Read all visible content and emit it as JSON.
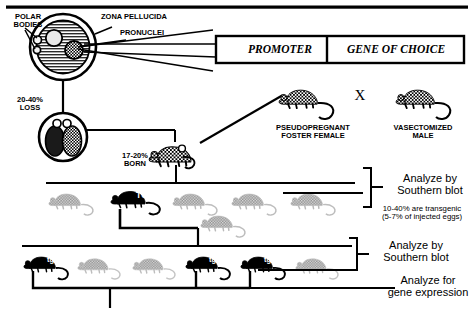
{
  "egg": {
    "polar_bodies_label": "POLAR\nBODIES",
    "zona_label": "ZONA PELLUCIDA",
    "pronuclei_label": "PRONUCLEI"
  },
  "construct": {
    "promoter": "PROMOTER",
    "gene": "GENE OF CHOICE"
  },
  "stages": {
    "loss_label": "20-40%\nLOSS",
    "born_label": "17-20%\nBORN"
  },
  "cross": {
    "female_label": "PSEUDOPREGNANT\nFOSTER FEMALE",
    "male_label": "VASECTOMIZED\nMALE",
    "cross_symbol": "X"
  },
  "analysis": {
    "southern_1": "Analyze by\nSouthern blot",
    "rate_note": "10-40% are transgenic\n(5-7% of injected eggs)",
    "southern_2": "Analyze by\nSouthern blot",
    "expression": "Analyze for\ngene expression"
  },
  "mice": {
    "tg_tag": "TG",
    "tg_tag_small": "tg",
    "generation1": [
      {
        "type": "wild",
        "tag": ""
      },
      {
        "type": "transgenic",
        "tag": "TG"
      },
      {
        "type": "wild",
        "tag": ""
      },
      {
        "type": "wild",
        "tag": ""
      },
      {
        "type": "wild",
        "tag": ""
      },
      {
        "type": "wild",
        "tag": ""
      }
    ],
    "generation2": [
      {
        "type": "transgenic",
        "tag": "tg"
      },
      {
        "type": "wild",
        "tag": ""
      },
      {
        "type": "wild",
        "tag": ""
      },
      {
        "type": "transgenic",
        "tag": "tg"
      },
      {
        "type": "transgenic",
        "tag": "tg"
      },
      {
        "type": "wild",
        "tag": ""
      }
    ]
  },
  "colors": {
    "ink": "#000000",
    "wild_mouse": "#9a9a9a",
    "transgenic_mouse": "#000000",
    "background": "#ffffff"
  }
}
